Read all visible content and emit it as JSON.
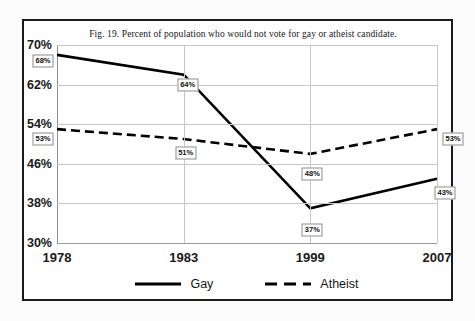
{
  "chart_data": {
    "type": "line",
    "title": "Fig. 19. Percent of population who would not vote for gay or atheist candidate.",
    "xlabel": "",
    "ylabel": "",
    "categories": [
      "1978",
      "1983",
      "1999",
      "2007"
    ],
    "ylim": [
      30,
      70
    ],
    "yticks": [
      "30%",
      "38%",
      "46%",
      "54%",
      "62%",
      "70%"
    ],
    "ytick_values": [
      30,
      38,
      46,
      54,
      62,
      70
    ],
    "grid": true,
    "legend_position": "bottom",
    "series": [
      {
        "name": "Gay",
        "style": "solid",
        "color": "#000000",
        "values": [
          68,
          64,
          37,
          43
        ],
        "labels": [
          "68%",
          "64%",
          "37%",
          "43%"
        ]
      },
      {
        "name": "Atheist",
        "style": "dashed",
        "color": "#000000",
        "values": [
          53,
          51,
          48,
          53
        ],
        "labels": [
          "53%",
          "51%",
          "48%",
          "53%"
        ]
      }
    ]
  },
  "legend": {
    "entries": [
      {
        "label": "Gay",
        "style": "solid"
      },
      {
        "label": "Atheist",
        "style": "dashed"
      }
    ]
  }
}
